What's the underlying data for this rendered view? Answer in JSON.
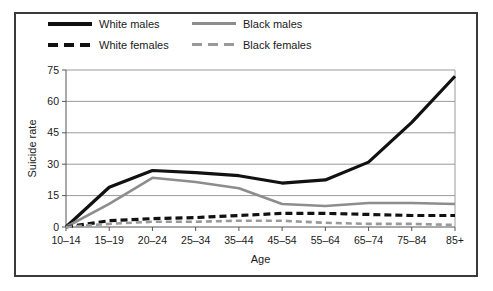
{
  "figure": {
    "frame_color": "#3a3a3a",
    "background": "#ffffff"
  },
  "legend": {
    "position": "top-left-inside",
    "entries": [
      {
        "label": "White males",
        "style": "solid",
        "color": "#111111",
        "swatch": "solid-black"
      },
      {
        "label": "Black males",
        "style": "solid",
        "color": "#8d8d8d",
        "swatch": "solid-gray"
      },
      {
        "label": "White females",
        "style": "dashed",
        "color": "#111111",
        "swatch": "dash-black"
      },
      {
        "label": "Black females",
        "style": "dashed",
        "color": "#9a9a9a",
        "swatch": "dash-gray"
      }
    ]
  },
  "axes": {
    "y_title": "Suicide rate",
    "x_title": "Age",
    "y_ticks": [
      "0",
      "15",
      "30",
      "45",
      "60",
      "75"
    ],
    "x_ticks": [
      "10–14",
      "15–19",
      "20–24",
      "25–34",
      "35–44",
      "45–54",
      "55–64",
      "65–74",
      "75–84",
      "85+"
    ]
  },
  "chart_data": {
    "type": "line",
    "title": "",
    "subtitle": "",
    "xlabel": "Age",
    "ylabel": "Suicide rate",
    "categories": [
      "10–14",
      "15–19",
      "20–24",
      "25–34",
      "35–44",
      "45–54",
      "55–64",
      "65–74",
      "75–84",
      "85+"
    ],
    "ylim": [
      0,
      75
    ],
    "yticks": [
      0,
      15,
      30,
      45,
      60,
      75
    ],
    "grid": "horizontal",
    "legend_position": "top-left",
    "series": [
      {
        "name": "White males",
        "color": "#111111",
        "style": "solid",
        "width": 3.2,
        "values": [
          0,
          19,
          27,
          26,
          24.5,
          21,
          22.5,
          31,
          50,
          72
        ]
      },
      {
        "name": "Black males",
        "color": "#8d8d8d",
        "style": "solid",
        "width": 2.6,
        "values": [
          0,
          11,
          23.5,
          21.5,
          18.5,
          11,
          10,
          11.5,
          11.5,
          11
        ]
      },
      {
        "name": "White females",
        "color": "#111111",
        "style": "dashed",
        "width": 3.2,
        "values": [
          0,
          3,
          4,
          4.5,
          5.5,
          6.5,
          6.5,
          6,
          5.5,
          5.5
        ]
      },
      {
        "name": "Black females",
        "color": "#9a9a9a",
        "style": "dashed",
        "width": 2.6,
        "values": [
          0,
          1.5,
          2.5,
          2.5,
          3,
          3,
          2,
          1.5,
          1.5,
          1
        ]
      }
    ]
  }
}
